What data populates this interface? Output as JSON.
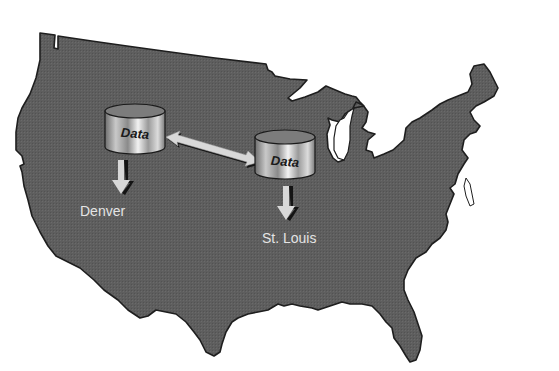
{
  "diagram": {
    "type": "network-map",
    "background": "map of the continental United States",
    "colors": {
      "land": "#5c5c5c",
      "land_outline": "#1e1e1e",
      "water": "#ffffff",
      "arrow": "#d8d8d8",
      "arrow_shadow": "#141414",
      "label": "#e4e4e4"
    },
    "nodes": [
      {
        "id": "db-denver",
        "shape": "database-cylinder",
        "label": "Data",
        "city": "Denver"
      },
      {
        "id": "db-stlouis",
        "shape": "database-cylinder",
        "label": "Data",
        "city": "St. Louis"
      }
    ],
    "edges": [
      {
        "from": "db-denver",
        "to": "db-stlouis",
        "style": "double-headed-arrow"
      },
      {
        "from": "db-denver",
        "to": "Denver",
        "style": "down-arrow"
      },
      {
        "from": "db-stlouis",
        "to": "St. Louis",
        "style": "down-arrow"
      }
    ]
  }
}
